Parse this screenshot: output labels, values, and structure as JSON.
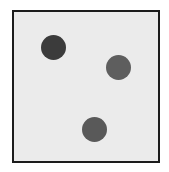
{
  "figure": {
    "frame": {
      "border_color": "#1c1c1c",
      "fill_color": "#ebebeb",
      "background_color": "#ffffff"
    },
    "dots": [
      {
        "id": "dot-1",
        "cx": 53,
        "cy": 47,
        "diameter": 25,
        "color": "#3b3b3b"
      },
      {
        "id": "dot-2",
        "cx": 118,
        "cy": 67,
        "diameter": 25,
        "color": "#5e5e5e"
      },
      {
        "id": "dot-3",
        "cx": 94,
        "cy": 129,
        "diameter": 25,
        "color": "#595959"
      }
    ]
  }
}
